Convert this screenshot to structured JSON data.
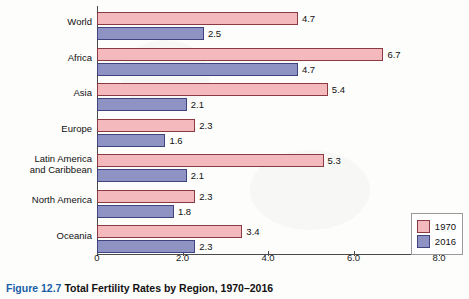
{
  "caption": {
    "figure_label": "Figure 12.7",
    "text": "Total Fertility Rates by Region, 1970–2016"
  },
  "legend": {
    "position": "right",
    "items": [
      {
        "label": "1970",
        "color": "#f4b9bd"
      },
      {
        "label": "2016",
        "color": "#8f93c4"
      }
    ]
  },
  "chart_data": {
    "type": "bar",
    "orientation": "horizontal",
    "title": "Total Fertility Rates by Region, 1970–2016",
    "xlabel": "",
    "ylabel": "",
    "xlim": [
      0.0,
      8.0
    ],
    "grid": false,
    "xticks": [
      "0",
      "2.0",
      "4.0",
      "6.0",
      "8.0"
    ],
    "xtick_values": [
      0,
      2,
      4,
      6,
      8
    ],
    "categories": [
      "World",
      "Africa",
      "Asia",
      "Europe",
      "Latin America\nand Caribbean",
      "North America",
      "Oceania"
    ],
    "series": [
      {
        "name": "1970",
        "color": "#f4b9bd",
        "values": [
          4.7,
          6.7,
          5.4,
          2.3,
          5.3,
          2.3,
          3.4
        ]
      },
      {
        "name": "2016",
        "color": "#8f93c4",
        "values": [
          2.5,
          4.7,
          2.1,
          1.6,
          2.1,
          1.8,
          2.3
        ]
      }
    ]
  }
}
